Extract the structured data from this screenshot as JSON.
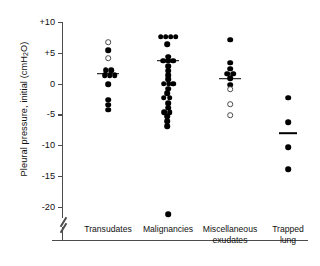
{
  "chart_data": {
    "type": "scatter",
    "title": "",
    "xlabel": "",
    "ylabel": "Pleural pressure, initial (cmH2O)",
    "ylabel_parts": {
      "pre": "Pleural pressure, initial (cmH",
      "sub": "2",
      "post": "O)"
    },
    "ylim": [
      -22.5,
      10
    ],
    "yticks": [
      10,
      5,
      0,
      -5,
      -10,
      -15,
      -20
    ],
    "ytick_labels": [
      "+10",
      "+5",
      "0",
      "-5",
      "-10",
      "-15",
      "-20"
    ],
    "axis_break": true,
    "axis_break_note": "broken y-axis below -20",
    "grid": false,
    "legend": "none",
    "marker_types": {
      "filled": "filled circle",
      "open": "open circle"
    },
    "categories": [
      "Transudates",
      "Malignancies",
      "Miscellaneous exudates",
      "Trapped lung"
    ],
    "category_labels": [
      "Transudates",
      "Malignancies",
      "Miscellaneous\nexudates",
      "Trapped lung"
    ],
    "groups": [
      {
        "name": "Transudates",
        "mean": 1.6,
        "points": [
          {
            "value": 6.7,
            "marker": "open",
            "offset": 0
          },
          {
            "value": 5.4,
            "marker": "filled",
            "offset": 0
          },
          {
            "value": 4.1,
            "marker": "open",
            "offset": 0
          },
          {
            "value": 2.2,
            "marker": "filled",
            "offset": -2.5
          },
          {
            "value": 2.2,
            "marker": "filled",
            "offset": 3.0
          },
          {
            "value": 1.4,
            "marker": "filled",
            "offset": -3.5
          },
          {
            "value": 1.4,
            "marker": "filled",
            "offset": 1.5
          },
          {
            "value": 1.4,
            "marker": "filled",
            "offset": 6.5
          },
          {
            "value": -0.1,
            "marker": "filled",
            "offset": 0
          },
          {
            "value": -2.6,
            "marker": "filled",
            "offset": 0
          },
          {
            "value": -3.4,
            "marker": "filled",
            "offset": 0
          },
          {
            "value": -4.2,
            "marker": "filled",
            "offset": 0
          }
        ]
      },
      {
        "name": "Malignancies",
        "mean": 3.7,
        "points": [
          {
            "value": 7.6,
            "marker": "filled",
            "offset": -7.5
          },
          {
            "value": 7.6,
            "marker": "filled",
            "offset": -2.5
          },
          {
            "value": 7.6,
            "marker": "filled",
            "offset": 2.5
          },
          {
            "value": 7.6,
            "marker": "filled",
            "offset": 7.5
          },
          {
            "value": 6.4,
            "marker": "filled",
            "offset": -1.0
          },
          {
            "value": 4.4,
            "marker": "filled",
            "offset": 0
          },
          {
            "value": 3.7,
            "marker": "filled",
            "offset": -5.0
          },
          {
            "value": 3.7,
            "marker": "filled",
            "offset": 0
          },
          {
            "value": 3.7,
            "marker": "filled",
            "offset": 5.0
          },
          {
            "value": 2.8,
            "marker": "filled",
            "offset": 0
          },
          {
            "value": 2.1,
            "marker": "filled",
            "offset": 0
          },
          {
            "value": 1.4,
            "marker": "filled",
            "offset": 0
          },
          {
            "value": 0.7,
            "marker": "filled",
            "offset": 0
          },
          {
            "value": 0.0,
            "marker": "filled",
            "offset": -4.5
          },
          {
            "value": 0.0,
            "marker": "filled",
            "offset": 0.5
          },
          {
            "value": 0.0,
            "marker": "filled",
            "offset": 5.0
          },
          {
            "value": -0.8,
            "marker": "filled",
            "offset": 0
          },
          {
            "value": -1.6,
            "marker": "filled",
            "offset": -1.0
          },
          {
            "value": -2.3,
            "marker": "filled",
            "offset": -4.5
          },
          {
            "value": -2.3,
            "marker": "filled",
            "offset": 1.5
          },
          {
            "value": -3.2,
            "marker": "filled",
            "offset": 0
          },
          {
            "value": -3.9,
            "marker": "filled",
            "offset": 0
          },
          {
            "value": -4.6,
            "marker": "filled",
            "offset": -4.0
          },
          {
            "value": -4.6,
            "marker": "filled",
            "offset": 1.5
          },
          {
            "value": -5.3,
            "marker": "filled",
            "offset": -1.0
          },
          {
            "value": -6.1,
            "marker": "filled",
            "offset": -1.0
          },
          {
            "value": -6.9,
            "marker": "filled",
            "offset": -1.0
          },
          {
            "value": -21.2,
            "marker": "filled",
            "offset": 0
          }
        ]
      },
      {
        "name": "Miscellaneous exudates",
        "mean": 0.8,
        "points": [
          {
            "value": 7.1,
            "marker": "filled",
            "offset": 0
          },
          {
            "value": 3.4,
            "marker": "filled",
            "offset": 0
          },
          {
            "value": 2.4,
            "marker": "filled",
            "offset": 0
          },
          {
            "value": 1.6,
            "marker": "filled",
            "offset": -3.0
          },
          {
            "value": 1.6,
            "marker": "filled",
            "offset": 3.0
          },
          {
            "value": 0.9,
            "marker": "filled",
            "offset": 0
          },
          {
            "value": -0.2,
            "marker": "filled",
            "offset": 0
          },
          {
            "value": -0.9,
            "marker": "open",
            "offset": 0
          },
          {
            "value": -3.3,
            "marker": "open",
            "offset": 0
          },
          {
            "value": -5.1,
            "marker": "open",
            "offset": 0
          }
        ]
      },
      {
        "name": "Trapped lung",
        "mean": -8.0,
        "points": [
          {
            "value": -2.3,
            "marker": "filled",
            "offset": 0
          },
          {
            "value": -6.3,
            "marker": "filled",
            "offset": 0
          },
          {
            "value": -10.3,
            "marker": "filled",
            "offset": 0
          },
          {
            "value": -13.9,
            "marker": "filled",
            "offset": 0
          }
        ]
      }
    ]
  }
}
